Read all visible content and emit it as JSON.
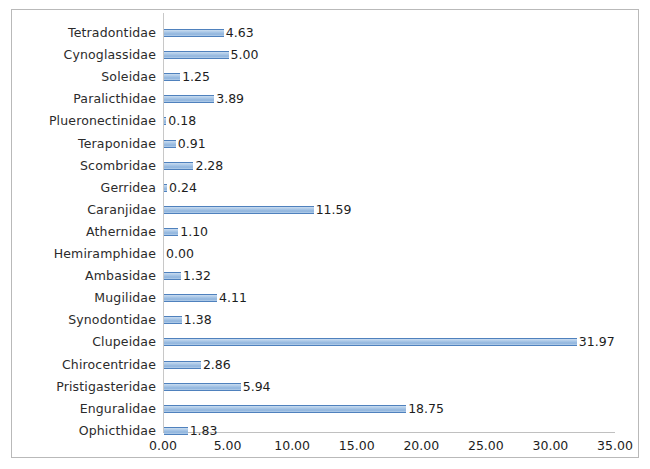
{
  "chart_data": {
    "type": "bar",
    "orientation": "horizontal",
    "title": "",
    "subtitle": "",
    "xlabel": "",
    "ylabel": "",
    "xlim": [
      0.0,
      35.0
    ],
    "xtick_step": 5.0,
    "grid": false,
    "legend": false,
    "legend_position": "none",
    "value_labels": true,
    "value_label_format": "0.00",
    "categories": [
      "Tetradontidae",
      "Cynoglassidae",
      "Soleidae",
      "Paralicthidae",
      "Plueronectinidae",
      "Teraponidae",
      "Scombridae",
      "Gerridea",
      "Caranjidae",
      "Athernidae",
      "Hemiramphidae",
      "Ambasidae",
      "Mugilidae",
      "Synodontidae",
      "Clupeidae",
      "Chirocentridae",
      "Pristigasteridae",
      "Enguralidae",
      "Ophicthidae"
    ],
    "values": [
      4.63,
      5.0,
      1.25,
      3.89,
      0.18,
      0.91,
      2.28,
      0.24,
      11.59,
      1.1,
      0.0,
      1.32,
      4.11,
      1.38,
      31.97,
      2.86,
      5.94,
      18.75,
      1.83
    ],
    "value_text": [
      "4.63",
      "5.00",
      "1.25",
      "3.89",
      "0.18",
      "0.91",
      "2.28",
      "0.24",
      "11.59",
      "1.10",
      "0.00",
      "1.32",
      "4.11",
      "1.38",
      "31.97",
      "2.86",
      "5.94",
      "18.75",
      "1.83"
    ],
    "xticks": [
      0.0,
      5.0,
      10.0,
      15.0,
      20.0,
      25.0,
      30.0,
      35.0
    ],
    "xtick_labels": [
      "0.00",
      "5.00",
      "10.00",
      "15.00",
      "20.00",
      "25.00",
      "30.00",
      "35.00"
    ],
    "colors": {
      "bar_fill": "#a8c6e6",
      "bar_edge": "#4f81bd",
      "axis_line": "#c8c8c8",
      "text": "#2b2b2b",
      "background": "#ffffff",
      "frame_border": "#b9b9b9"
    }
  }
}
